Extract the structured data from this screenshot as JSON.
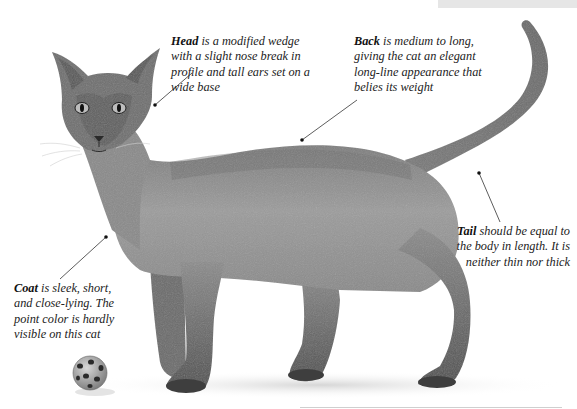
{
  "header": {
    "band_text": "SIAMESE"
  },
  "annotations": {
    "head": {
      "term": "Head",
      "text": " is a modified wedge with a slight nose break in profile and tall ears set on a wide base"
    },
    "back": {
      "term": "Back",
      "text": " is medium to long, giving the cat an elegant long-line appearance that belies its weight"
    },
    "tail": {
      "term": "Tail",
      "text": " should be equal to the body in length. It is neither thin nor thick"
    },
    "coat": {
      "term": "Coat",
      "text": " is sleek, short, and close-lying. The point color is hardly visible on this cat"
    }
  },
  "illustration": {
    "subject": "cat-standing-side-view",
    "prop": "ball-with-holes",
    "colors": {
      "fur_light": "#9a9a9a",
      "fur_mid": "#7d7d7d",
      "fur_dark": "#4a4a4a",
      "shadow": "#e2e2e2",
      "pointer": "#333333"
    }
  }
}
